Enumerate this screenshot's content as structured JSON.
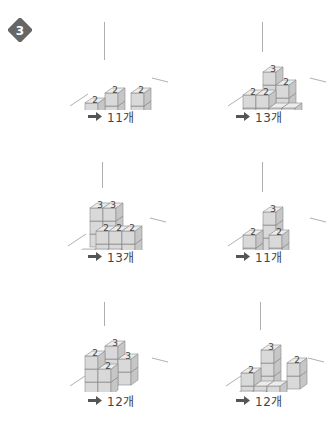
{
  "problem": {
    "number": "3",
    "badge_color": "#666666"
  },
  "colors": {
    "cube_front": "#d9d9d9",
    "cube_side": "#c6c6c6",
    "cube_top": "#ececec",
    "cube_edge": "#8a8a8a",
    "axis": "#9a9a9a",
    "label": "#444444"
  },
  "answer_suffix": "개",
  "figures": [
    {
      "id": "fig-1",
      "answer": "11개",
      "count": 11,
      "top_labels": [
        "2",
        "2",
        "2"
      ]
    },
    {
      "id": "fig-2",
      "answer": "13개",
      "count": 13,
      "top_labels": [
        "3",
        "2",
        "2",
        "2"
      ]
    },
    {
      "id": "fig-3",
      "answer": "13개",
      "count": 13,
      "top_labels": [
        "3",
        "3",
        "2",
        "2",
        "2"
      ]
    },
    {
      "id": "fig-4",
      "answer": "11개",
      "count": 11,
      "top_labels": [
        "3",
        "2",
        "2"
      ]
    },
    {
      "id": "fig-5",
      "answer": "12개",
      "count": 12,
      "top_labels": [
        "3",
        "3",
        "2",
        "2",
        "2"
      ]
    },
    {
      "id": "fig-6",
      "answer": "12개",
      "count": 12,
      "top_labels": [
        "3",
        "2",
        "2"
      ]
    }
  ]
}
